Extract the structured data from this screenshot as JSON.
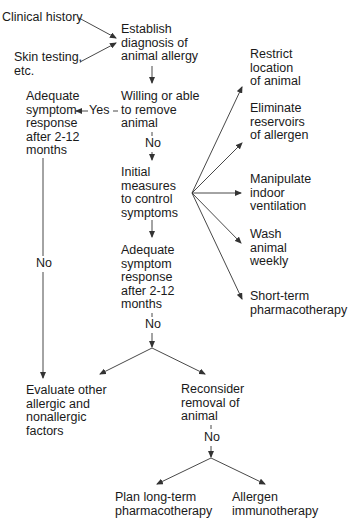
{
  "diagram": {
    "type": "flowchart",
    "title": "",
    "nodes": {
      "clinical_history": "Clinical history",
      "skin_testing": "Skin testing,\netc.",
      "establish_diagnosis": "Establish\ndiagnosis of\nanimal allergy",
      "willing_remove": "Willing or able\nto remove\nanimal",
      "adequate_response_1": "Adequate\nsymptom\nresponse\nafter 2-12\nmonths",
      "initial_measures": "Initial\nmeasures\nto control\nsymptoms",
      "adequate_response_2": "Adequate\nsymptom\nresponse\nafter 2-12\nmonths",
      "restrict_location": "Restrict\nlocation\nof animal",
      "eliminate_reservoirs": "Eliminate\nreservoirs\nof allergen",
      "manipulate_ventilation": "Manipulate\nindoor\nventilation",
      "wash_animal": "Wash\nanimal\nweekly",
      "short_term_pharma": "Short-term\npharmacotherapy",
      "evaluate_other": "Evaluate other\nallergic and\nnonallergic\nfactors",
      "reconsider_removal": "Reconsider\nremoval of\nanimal",
      "plan_long_term": "Plan long-term\npharmacotherapy",
      "allergen_immunotherapy": "Allergen\nimmunotherapy"
    },
    "edge_labels": {
      "yes": "Yes",
      "no_willing": "No",
      "no_adequate_1": "No",
      "no_adequate_2": "No",
      "no_reconsider": "No"
    },
    "edges": [
      {
        "from": "clinical_history",
        "to": "establish_diagnosis"
      },
      {
        "from": "skin_testing",
        "to": "establish_diagnosis"
      },
      {
        "from": "establish_diagnosis",
        "to": "willing_remove"
      },
      {
        "from": "willing_remove",
        "to": "adequate_response_1",
        "label": "Yes"
      },
      {
        "from": "willing_remove",
        "to": "initial_measures",
        "label": "No"
      },
      {
        "from": "adequate_response_1",
        "to": "evaluate_other",
        "label": "No"
      },
      {
        "from": "initial_measures",
        "to": "restrict_location"
      },
      {
        "from": "initial_measures",
        "to": "eliminate_reservoirs"
      },
      {
        "from": "initial_measures",
        "to": "manipulate_ventilation"
      },
      {
        "from": "initial_measures",
        "to": "wash_animal"
      },
      {
        "from": "initial_measures",
        "to": "short_term_pharma"
      },
      {
        "from": "initial_measures",
        "to": "adequate_response_2"
      },
      {
        "from": "adequate_response_2",
        "to": "evaluate_other",
        "label": "No"
      },
      {
        "from": "adequate_response_2",
        "to": "reconsider_removal",
        "label": "No"
      },
      {
        "from": "reconsider_removal",
        "to": "plan_long_term",
        "label": "No"
      },
      {
        "from": "reconsider_removal",
        "to": "allergen_immunotherapy",
        "label": "No"
      }
    ]
  }
}
